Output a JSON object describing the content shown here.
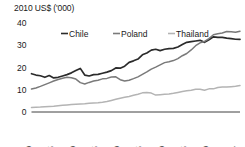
{
  "chart_data": {
    "type": "line",
    "title": "",
    "ylabel": "2010 US$ ('000)",
    "xlabel": "",
    "ylim": [
      0,
      40
    ],
    "yticks": [
      0,
      10,
      20,
      30,
      40
    ],
    "xlim": [
      1970,
      2017
    ],
    "xticks": [
      1970,
      1975,
      1980,
      1985,
      1990,
      1995,
      2000,
      2005,
      2010,
      2017
    ],
    "grid": false,
    "legend_position": "top",
    "x": [
      1970,
      1971,
      1972,
      1973,
      1974,
      1975,
      1976,
      1977,
      1978,
      1979,
      1980,
      1981,
      1982,
      1983,
      1984,
      1985,
      1986,
      1987,
      1988,
      1989,
      1990,
      1991,
      1992,
      1993,
      1994,
      1995,
      1996,
      1997,
      1998,
      1999,
      2000,
      2001,
      2002,
      2003,
      2004,
      2005,
      2006,
      2007,
      2008,
      2009,
      2010,
      2011,
      2012,
      2013,
      2014,
      2015,
      2016,
      2017
    ],
    "series": [
      {
        "name": "Chile",
        "color": "#2b2b2b",
        "values": [
          17.2,
          16.6,
          16.3,
          15.6,
          16.4,
          15.3,
          15.6,
          16.2,
          16.8,
          17.6,
          18.6,
          19.6,
          16.6,
          16.2,
          16.8,
          16.9,
          17.4,
          17.9,
          18.6,
          19.8,
          19.7,
          20.6,
          22.3,
          23.0,
          23.8,
          25.7,
          26.5,
          27.8,
          28.2,
          27.6,
          28.2,
          28.5,
          28.6,
          29.2,
          30.3,
          31.3,
          31.6,
          31.9,
          32.2,
          31.3,
          32.5,
          33.8,
          33.5,
          33.5,
          33.2,
          33.0,
          32.7,
          32.6
        ]
      },
      {
        "name": "Poland",
        "color": "#7a7a7a",
        "values": [
          10.3,
          10.8,
          11.5,
          12.3,
          13.1,
          13.9,
          14.6,
          15.2,
          15.6,
          15.4,
          14.8,
          13.2,
          12.6,
          13.3,
          13.9,
          14.3,
          14.9,
          15.1,
          15.7,
          15.8,
          14.5,
          13.9,
          14.3,
          15.0,
          15.8,
          16.9,
          18.0,
          19.3,
          20.2,
          21.2,
          22.2,
          22.6,
          23.1,
          24.0,
          25.3,
          26.3,
          27.9,
          29.8,
          31.1,
          31.7,
          33.0,
          34.7,
          35.2,
          35.5,
          36.2,
          36.1,
          35.8,
          36.3
        ]
      },
      {
        "name": "Thailand",
        "color": "#b4b4b4",
        "values": [
          2.0,
          2.1,
          2.2,
          2.4,
          2.5,
          2.6,
          2.8,
          3.0,
          3.2,
          3.4,
          3.5,
          3.6,
          3.7,
          3.9,
          4.1,
          4.2,
          4.4,
          4.7,
          5.2,
          5.7,
          6.2,
          6.6,
          7.0,
          7.5,
          8.0,
          8.6,
          8.8,
          8.5,
          7.6,
          7.8,
          8.0,
          8.1,
          8.4,
          8.8,
          9.2,
          9.5,
          9.8,
          10.2,
          10.2,
          9.8,
          10.4,
          10.4,
          11.0,
          11.2,
          11.2,
          11.4,
          11.6,
          11.9
        ]
      }
    ],
    "legend": [
      "Chile",
      "Poland",
      "Thailand"
    ]
  }
}
